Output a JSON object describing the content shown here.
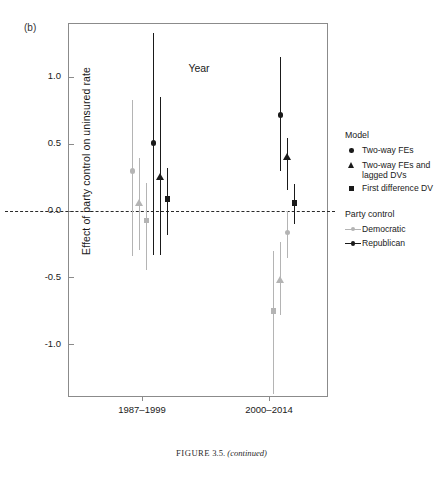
{
  "figure": {
    "panel_label": "(b)",
    "caption_prefix": "FIGURE",
    "caption_number": "3.5.",
    "caption_note": "(continued)"
  },
  "legend": {
    "model_title": "Model",
    "model_items": [
      {
        "label": "Two-way FEs",
        "marker": "circle"
      },
      {
        "label": "Two-way FEs and lagged DVs",
        "marker": "triangle"
      },
      {
        "label": "First difference DV",
        "marker": "square"
      }
    ],
    "party_title": "Party control",
    "party_items": [
      {
        "label": "Democratic",
        "color": "#b4b4b4"
      },
      {
        "label": "Republican",
        "color": "#1a1a1a"
      }
    ]
  },
  "chart_data": {
    "type": "scatter",
    "title": "",
    "xlabel": "Year",
    "ylabel": "Effect of party control on uninsured rate",
    "categories": [
      "1987–1999",
      "2000–2014"
    ],
    "yticks": [
      1.0,
      0.5,
      0.0,
      -0.5,
      -1.0
    ],
    "ytick_labels": [
      "1.0",
      "0.5",
      "0.0",
      "-0.5",
      "-1.0"
    ],
    "ylim": [
      -1.4,
      1.4
    ],
    "grid": false,
    "reference_line": 0.0,
    "legend_position": "right",
    "colors": {
      "democratic": "#b4b4b4",
      "republican": "#1a1a1a"
    },
    "series": [
      {
        "name": "Democratic",
        "color": "#b4b4b4",
        "points": [
          {
            "category": "1987–1999",
            "model": "Two-way FEs",
            "marker": "circle",
            "value": 0.3,
            "ci_low": -0.34,
            "ci_high": 0.83
          },
          {
            "category": "1987–1999",
            "model": "Two-way FEs and lagged DVs",
            "marker": "triangle",
            "value": 0.06,
            "ci_low": -0.29,
            "ci_high": 0.4
          },
          {
            "category": "1987–1999",
            "model": "First difference DV",
            "marker": "square",
            "value": -0.07,
            "ci_low": -0.44,
            "ci_high": 0.21
          },
          {
            "category": "2000–2014",
            "model": "Two-way FEs",
            "marker": "circle",
            "value": -0.16,
            "ci_low": -0.35,
            "ci_high": 0.0
          },
          {
            "category": "2000–2014",
            "model": "Two-way FEs and lagged DVs",
            "marker": "triangle",
            "value": -0.51,
            "ci_low": -0.78,
            "ci_high": -0.23
          },
          {
            "category": "2000–2014",
            "model": "First difference DV",
            "marker": "square",
            "value": -0.75,
            "ci_low": -1.37,
            "ci_high": -0.3
          }
        ]
      },
      {
        "name": "Republican",
        "color": "#1a1a1a",
        "points": [
          {
            "category": "1987–1999",
            "model": "Two-way FEs",
            "marker": "circle",
            "value": 0.51,
            "ci_low": -0.33,
            "ci_high": 1.33
          },
          {
            "category": "1987–1999",
            "model": "Two-way FEs and lagged DVs",
            "marker": "triangle",
            "value": 0.26,
            "ci_low": -0.33,
            "ci_high": 0.85
          },
          {
            "category": "1987–1999",
            "model": "First difference DV",
            "marker": "square",
            "value": 0.09,
            "ci_low": -0.18,
            "ci_high": 0.32
          },
          {
            "category": "2000–2014",
            "model": "Two-way FEs",
            "marker": "circle",
            "value": 0.72,
            "ci_low": 0.3,
            "ci_high": 1.15
          },
          {
            "category": "2000–2014",
            "model": "Two-way FEs and lagged DVs",
            "marker": "triangle",
            "value": 0.41,
            "ci_low": 0.16,
            "ci_high": 0.55
          },
          {
            "category": "2000–2014",
            "model": "First difference DV",
            "marker": "square",
            "value": 0.06,
            "ci_low": -0.1,
            "ci_high": 0.2
          }
        ]
      }
    ]
  }
}
